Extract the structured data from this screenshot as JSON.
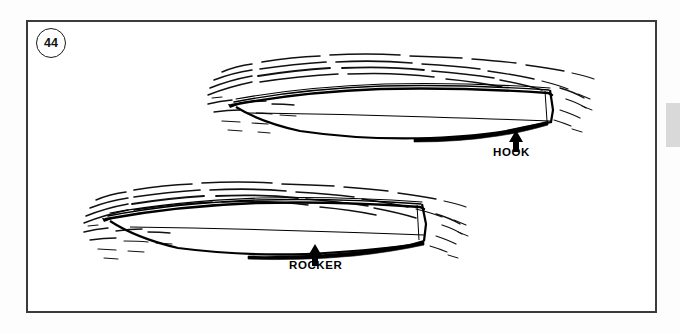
{
  "page": {
    "background_color": "#ffffff",
    "frame_color": "#3b3b3b",
    "ink_color": "#000000"
  },
  "figure": {
    "number": "44",
    "number_badge_shape": "circle"
  },
  "edge_tab": {
    "color": "#d9d9d9"
  },
  "diagrams": [
    {
      "id": "hull-hook",
      "label": "HOOK",
      "description": "Boat hull profile, bow at left, stern at right, with concave hook in the aft bottom",
      "arrow": "up-arrow",
      "position": "top"
    },
    {
      "id": "hull-rocker",
      "label": "ROCKER",
      "description": "Boat hull profile, bow at left, stern at right, with convex rocker in the bottom",
      "arrow": "up-arrow",
      "position": "bottom"
    }
  ]
}
